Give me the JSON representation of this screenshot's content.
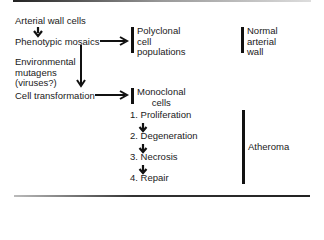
{
  "diagram": {
    "left": {
      "arterial_wall_cells": "Arterial wall cells",
      "phenotypic_mosaics": "Phenotypic mosaics",
      "environmental_mutagens": "Environmental\nmutagens\n(viruses?)",
      "cell_transformation": "Cell transformation"
    },
    "middle": {
      "polyclonal": "Polyclonal\ncell\npopulations",
      "monoclonal": "Monoclonal\ncells",
      "steps": [
        "1. Proliferation",
        "2. Degeneration",
        "3. Necrosis",
        "4. Repair"
      ]
    },
    "right": {
      "normal_wall": "Normal\narterial\nwall",
      "atheroma": "Atheroma"
    }
  }
}
